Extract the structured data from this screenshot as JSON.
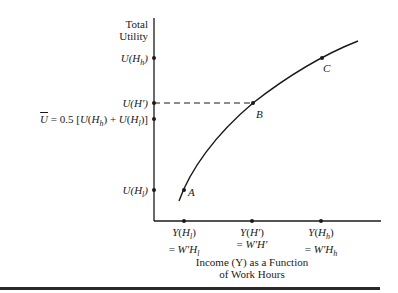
{
  "figure": {
    "y_axis_title_line1": "Total",
    "y_axis_title_line2": "Utility",
    "x_axis_title_line1": "Income (Y) as a Function",
    "x_axis_title_line2": "of Work Hours",
    "y_ticks": [
      {
        "label": "U(Hh)",
        "y": 58
      },
      {
        "label": "U(H′)",
        "y": 103
      },
      {
        "label": "Ū = 0.5 [U(Hh) + U(Hl)]",
        "y": 119
      },
      {
        "label": "U(Hl)",
        "y": 190
      }
    ],
    "x_ticks": [
      {
        "line1": "Y(Hl)",
        "line2": "= W′Hl",
        "x": 184
      },
      {
        "line1": "Y(H′)",
        "line2": "= W′H′",
        "x": 252
      },
      {
        "line1": "Y(Hh)",
        "line2": "= W′Hh",
        "x": 321
      }
    ],
    "points": [
      {
        "label": "A",
        "x": 184,
        "y": 190
      },
      {
        "label": "B",
        "x": 253,
        "y": 103
      },
      {
        "label": "C",
        "x": 322,
        "y": 58
      }
    ],
    "colors": {
      "ink": "#1a1a1a",
      "background": "#ffffff"
    }
  }
}
